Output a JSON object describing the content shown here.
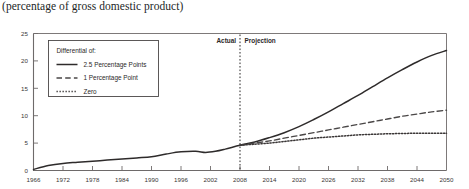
{
  "chart_data": {
    "type": "line",
    "title": "(percentage of gross domestic product)",
    "xlabel": "",
    "ylabel": "",
    "xlim": [
      1966,
      2050
    ],
    "ylim": [
      0,
      25
    ],
    "yticks": [
      0,
      5,
      10,
      15,
      20,
      25
    ],
    "xticks": [
      1966,
      1972,
      1978,
      1984,
      1990,
      1996,
      2002,
      2008,
      2014,
      2020,
      2026,
      2032,
      2038,
      2044,
      2050
    ],
    "grid": false,
    "legend_position": "upper-left",
    "legend_title": "Differential of:",
    "annotations": [
      {
        "text": "Actual",
        "x": 2006,
        "style": "right-of-divider"
      },
      {
        "text": "Projection",
        "x": 2010,
        "style": "left-of-divider"
      }
    ],
    "divider": {
      "x": 2008,
      "style": "dotted",
      "label_left": "Actual",
      "label_right": "Projection"
    },
    "series": [
      {
        "name": "2.5 Percentage Points",
        "style": "solid",
        "color": "#2e2b2b",
        "x": [
          1966,
          1969,
          1972,
          1975,
          1978,
          1981,
          1984,
          1987,
          1990,
          1993,
          1996,
          1999,
          2001,
          2003,
          2005,
          2008,
          2011,
          2014,
          2017,
          2020,
          2023,
          2026,
          2029,
          2032,
          2035,
          2038,
          2041,
          2044,
          2047,
          2050
        ],
        "values": [
          0.2,
          0.9,
          1.3,
          1.5,
          1.7,
          1.9,
          2.1,
          2.3,
          2.5,
          3.0,
          3.4,
          3.5,
          3.3,
          3.5,
          3.9,
          4.6,
          5.2,
          6.0,
          6.9,
          8.0,
          9.3,
          10.7,
          12.2,
          13.7,
          15.3,
          16.9,
          18.4,
          19.8,
          21.0,
          21.9
        ]
      },
      {
        "name": "1 Percentage Point",
        "style": "dashed",
        "color": "#4a4747",
        "x": [
          2008,
          2011,
          2014,
          2017,
          2020,
          2023,
          2026,
          2029,
          2032,
          2035,
          2038,
          2041,
          2044,
          2047,
          2050
        ],
        "values": [
          4.6,
          5.0,
          5.4,
          5.9,
          6.4,
          6.9,
          7.4,
          7.9,
          8.4,
          8.9,
          9.4,
          9.9,
          10.3,
          10.7,
          11.0
        ]
      },
      {
        "name": "Zero",
        "style": "dotted",
        "color": "#3a3636",
        "x": [
          2008,
          2011,
          2014,
          2017,
          2020,
          2023,
          2026,
          2029,
          2032,
          2035,
          2038,
          2041,
          2044,
          2047,
          2050
        ],
        "values": [
          4.6,
          4.8,
          5.0,
          5.3,
          5.6,
          5.9,
          6.1,
          6.3,
          6.5,
          6.6,
          6.7,
          6.75,
          6.8,
          6.8,
          6.8
        ]
      }
    ]
  },
  "legend": {
    "title": "Differential of:",
    "items": [
      {
        "label": "2.5 Percentage Points",
        "style": "solid"
      },
      {
        "label": "1 Percentage Point",
        "style": "dashed"
      },
      {
        "label": "Zero",
        "style": "dotted"
      }
    ]
  },
  "colors": {
    "axis": "#6e6a6a",
    "line_primary": "#2e2b2b",
    "line_secondary": "#4a4747",
    "line_tertiary": "#3a3636",
    "text": "#231f1f",
    "background": "#ffffff"
  }
}
